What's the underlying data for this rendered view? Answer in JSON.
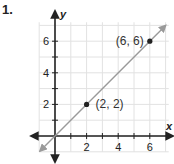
{
  "problem": {
    "number": "1."
  },
  "chart_data": {
    "type": "line",
    "title": "",
    "xlabel": "x",
    "ylabel": "y",
    "xlim": [
      -1,
      7
    ],
    "ylim": [
      -1,
      7
    ],
    "grid": true,
    "x_ticks": [
      1,
      2,
      3,
      4,
      5,
      6
    ],
    "x_tick_labels": [
      "2",
      "4",
      "6"
    ],
    "y_ticks": [
      1,
      2,
      3,
      4,
      5,
      6
    ],
    "y_tick_labels": [
      "2",
      "4",
      "6"
    ],
    "series": [
      {
        "name": "line y = x",
        "x": [
          -1,
          7
        ],
        "y": [
          -1,
          7
        ],
        "color": "#9a9a9a",
        "arrows": "both"
      }
    ],
    "points": [
      {
        "x": 2,
        "y": 2,
        "label": "(2, 2)"
      },
      {
        "x": 6,
        "y": 6,
        "label": "(6, 6)"
      }
    ]
  },
  "colors": {
    "axis": "#222222",
    "grid": "#e2e2e2",
    "line": "#9a9a9a",
    "point": "#222222"
  }
}
